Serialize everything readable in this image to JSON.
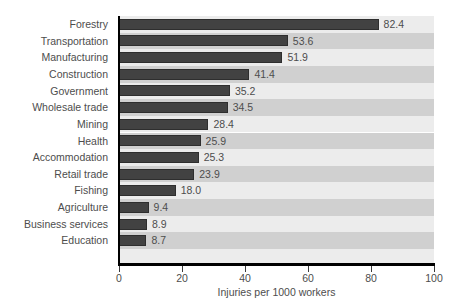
{
  "chart_data": {
    "type": "bar",
    "orientation": "horizontal",
    "title": "",
    "xlabel": "Injuries per 1000 workers",
    "ylabel": "",
    "xlim": [
      0,
      100
    ],
    "xticks": [
      0,
      20,
      40,
      60,
      80,
      100
    ],
    "xtick_labels": [
      "0",
      "20",
      "40",
      "60",
      "80",
      "100"
    ],
    "grid": false,
    "legend": false,
    "bar_color": "#424242",
    "band_color_light": "#ececec",
    "band_color_dark": "#d0d0d0",
    "categories": [
      "Forestry",
      "Transportation",
      "Manufacturing",
      "Construction",
      "Government",
      "Wholesale trade",
      "Mining",
      "Health",
      "Accommodation",
      "Retail trade",
      "Fishing",
      "Agriculture",
      "Business services",
      "Education"
    ],
    "values": [
      82.4,
      53.6,
      51.9,
      41.4,
      35.2,
      34.5,
      28.4,
      25.9,
      25.3,
      23.9,
      18.0,
      9.4,
      8.9,
      8.7
    ],
    "value_labels": [
      "82.4",
      "53.6",
      "51.9",
      "41.4",
      "35.2",
      "34.5",
      "28.4",
      "25.9",
      "25.3",
      "23.9",
      "18.0",
      "9.4",
      "8.9",
      "8.7"
    ]
  }
}
